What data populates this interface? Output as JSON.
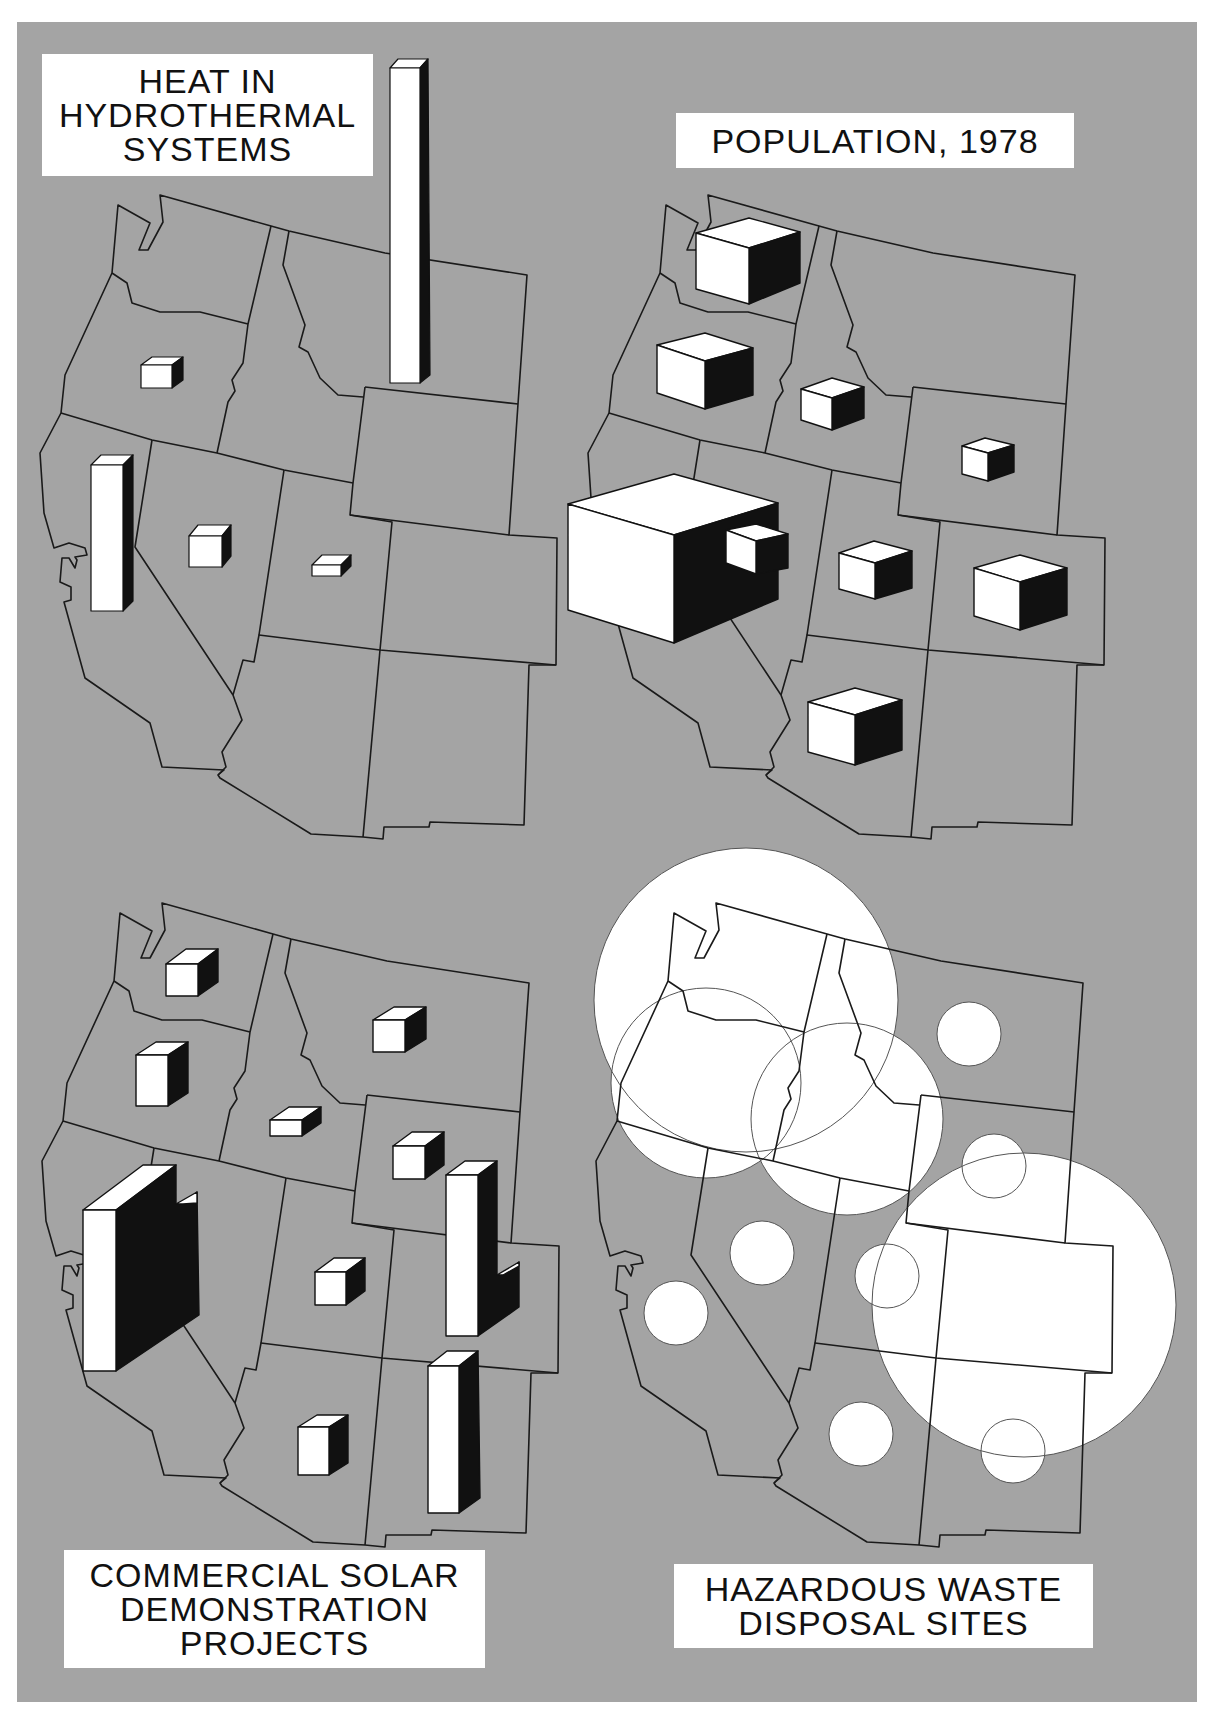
{
  "figure": {
    "background_color": "#a4a4a4",
    "state_outline_color": "#1a1a1a",
    "symbol_face_color": "#ffffff",
    "symbol_shadow_color": "#111111",
    "region": "Western United States",
    "states": [
      "WA",
      "OR",
      "CA",
      "ID",
      "NV",
      "MT",
      "WY",
      "UT",
      "CO",
      "AZ",
      "NM"
    ]
  },
  "panels": {
    "heat": {
      "title_lines": [
        "HEAT IN",
        "HYDROTHERMAL",
        "SYSTEMS"
      ],
      "symbol": "prism-bar",
      "symbols": [
        {
          "state": "MT",
          "relative_size": "very large"
        },
        {
          "state": "CA",
          "relative_size": "large"
        },
        {
          "state": "OR",
          "relative_size": "small"
        },
        {
          "state": "NV",
          "relative_size": "small"
        },
        {
          "state": "UT",
          "relative_size": "very small"
        }
      ]
    },
    "population": {
      "title_lines": [
        "POPULATION, 1978"
      ],
      "symbol": "cube",
      "symbols": [
        {
          "state": "CA",
          "relative_size": "very large"
        },
        {
          "state": "WA",
          "relative_size": "medium"
        },
        {
          "state": "OR",
          "relative_size": "medium"
        },
        {
          "state": "CO",
          "relative_size": "medium"
        },
        {
          "state": "AZ",
          "relative_size": "medium"
        },
        {
          "state": "ID",
          "relative_size": "small"
        },
        {
          "state": "UT",
          "relative_size": "small"
        },
        {
          "state": "NV",
          "relative_size": "small"
        },
        {
          "state": "WY",
          "relative_size": "very small"
        }
      ]
    },
    "solar": {
      "title_lines": [
        "COMMERCIAL SOLAR",
        "DEMONSTRATION",
        "PROJECTS"
      ],
      "symbol": "prism-bar",
      "symbols": [
        {
          "state": "CA",
          "relative_size": "very large"
        },
        {
          "state": "CO",
          "relative_size": "large"
        },
        {
          "state": "NM",
          "relative_size": "large"
        },
        {
          "state": "WA",
          "relative_size": "small"
        },
        {
          "state": "OR",
          "relative_size": "small"
        },
        {
          "state": "MT",
          "relative_size": "small"
        },
        {
          "state": "WY",
          "relative_size": "small"
        },
        {
          "state": "NV",
          "relative_size": "small"
        },
        {
          "state": "AZ",
          "relative_size": "small"
        },
        {
          "state": "ID",
          "relative_size": "very small"
        }
      ]
    },
    "hazardous": {
      "title_lines": [
        "HAZARDOUS WASTE",
        "DISPOSAL SITES"
      ],
      "symbol": "circle",
      "symbols": [
        {
          "state": "WA",
          "relative_size": "very large"
        },
        {
          "state": "CO",
          "relative_size": "very large"
        },
        {
          "state": "OR",
          "relative_size": "large"
        },
        {
          "state": "ID",
          "relative_size": "large"
        },
        {
          "state": "MT",
          "relative_size": "small"
        },
        {
          "state": "WY",
          "relative_size": "small"
        },
        {
          "state": "NV",
          "relative_size": "small"
        },
        {
          "state": "UT",
          "relative_size": "small"
        },
        {
          "state": "CA",
          "relative_size": "small"
        },
        {
          "state": "AZ",
          "relative_size": "small"
        },
        {
          "state": "NM",
          "relative_size": "small"
        }
      ]
    }
  }
}
